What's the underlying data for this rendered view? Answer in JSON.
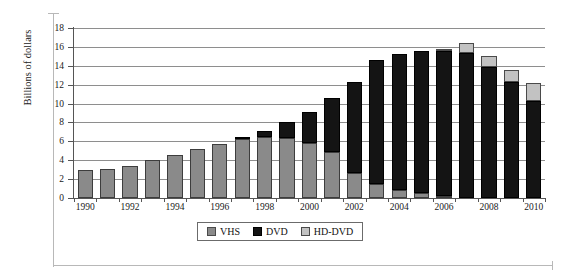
{
  "chart_data": {
    "type": "bar",
    "stacked": true,
    "title": "",
    "xlabel": "",
    "ylabel": "Billions of dollars",
    "ylim": [
      0,
      18
    ],
    "ytick_step": 2,
    "yticks": [
      0,
      2,
      4,
      6,
      8,
      10,
      12,
      14,
      16,
      18
    ],
    "grid": true,
    "legend_position": "bottom-center",
    "categories": [
      1990,
      1991,
      1992,
      1993,
      1994,
      1995,
      1996,
      1997,
      1998,
      1999,
      2000,
      2001,
      2002,
      2003,
      2004,
      2005,
      2006,
      2007,
      2008,
      2009,
      2010
    ],
    "xtick_labels": [
      "1990",
      "1992",
      "1994",
      "1996",
      "1998",
      "2000",
      "2002",
      "2004",
      "2006",
      "2008",
      "2010"
    ],
    "series": [
      {
        "name": "VHS",
        "color": "#8a8a8a",
        "values": [
          3.0,
          3.1,
          3.4,
          4.0,
          4.6,
          5.2,
          5.7,
          6.2,
          6.5,
          6.4,
          5.8,
          4.9,
          2.6,
          1.5,
          0.9,
          0.5,
          0.2,
          0.0,
          0.0,
          0.0,
          0.0
        ]
      },
      {
        "name": "DVD",
        "color": "#141414",
        "values": [
          0.0,
          0.0,
          0.0,
          0.0,
          0.0,
          0.0,
          0.0,
          0.3,
          0.6,
          1.6,
          3.3,
          5.7,
          9.7,
          13.1,
          14.4,
          15.1,
          15.4,
          15.4,
          13.9,
          12.3,
          10.3
        ]
      },
      {
        "name": "HD-DVD",
        "color": "#c2c2c2",
        "values": [
          0.0,
          0.0,
          0.0,
          0.0,
          0.0,
          0.0,
          0.0,
          0.0,
          0.0,
          0.0,
          0.0,
          0.0,
          0.0,
          0.0,
          0.0,
          0.0,
          0.2,
          1.0,
          1.1,
          1.3,
          1.9
        ]
      }
    ],
    "totals": [
      3.0,
      3.1,
      3.4,
      4.0,
      4.6,
      5.2,
      5.7,
      6.5,
      7.1,
      8.0,
      9.1,
      10.6,
      12.3,
      14.6,
      15.3,
      15.6,
      15.8,
      16.4,
      15.0,
      13.6,
      12.2
    ]
  },
  "legend": {
    "items": [
      {
        "label": "VHS",
        "color": "#8a8a8a"
      },
      {
        "label": "DVD",
        "color": "#141414"
      },
      {
        "label": "HD-DVD",
        "color": "#c2c2c2"
      }
    ]
  }
}
